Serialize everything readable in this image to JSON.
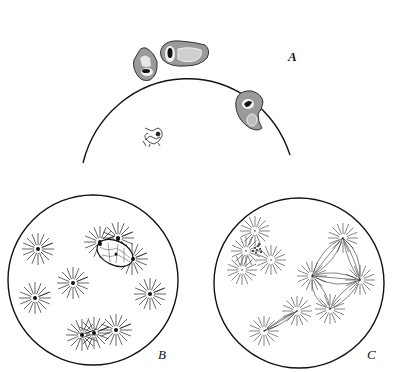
{
  "figure": {
    "panels": [
      {
        "id": "A",
        "label": "A",
        "description": "Partial circular field with three irregular cells with dark nuclei and a small flagellated organism"
      },
      {
        "id": "B",
        "label": "B",
        "description": "Circular field with multiple radiating asters with dark central bodies, one nucleus with reticulum"
      },
      {
        "id": "C",
        "label": "C",
        "description": "Circular field with multipolar spindles connecting asters"
      }
    ],
    "caption": ""
  }
}
